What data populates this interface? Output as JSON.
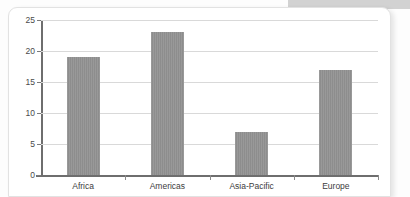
{
  "card": {
    "background_color": "#ffffff",
    "border_color": "#e2e2e2"
  },
  "top_band": {
    "name": "top-band",
    "color": "#d2d2d2"
  },
  "chart_data": {
    "type": "bar",
    "title": "",
    "subtitle": "",
    "xlabel": "",
    "ylabel": "",
    "categories": [
      "Africa",
      "Americas",
      "Asia-Pacific",
      "Europe"
    ],
    "values": [
      19,
      23,
      7,
      17
    ],
    "series": [
      {
        "name": "",
        "values": [
          19,
          23,
          7,
          17
        ]
      }
    ],
    "ylim": [
      0,
      25
    ],
    "ytick_values": [
      0,
      5,
      10,
      15,
      20,
      25
    ],
    "ytick_labels": [
      "0",
      "5",
      "10",
      "15",
      "20",
      "25"
    ],
    "grid": true,
    "grid_axis": "y",
    "legend": false,
    "legend_position": "none",
    "bar_color": "#8d8d8d",
    "gridline_color": "#d9d9d9",
    "axis_color": "#6e6e6e",
    "tick_label_color": "#4a4a4a",
    "annotations": []
  }
}
